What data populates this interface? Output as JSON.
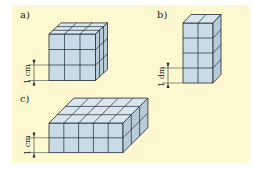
{
  "figures": [
    {
      "id": "a",
      "label": "a)",
      "unit_label": "1 cm",
      "width": 3,
      "height": 3,
      "depth": 3
    },
    {
      "id": "b",
      "label": "b)",
      "unit_label": "1 dm",
      "width": 2,
      "height": 4,
      "depth": 1
    },
    {
      "id": "c",
      "label": "c)",
      "unit_label": "1 cm",
      "width": 5,
      "height": 2,
      "depth": 3
    }
  ],
  "colors": {
    "background": "#fdf8cf",
    "cube_front": "#c9dbe6",
    "cube_top": "#d9e6ee",
    "cube_side": "#b7cad6",
    "edge": "#1e2a33"
  }
}
